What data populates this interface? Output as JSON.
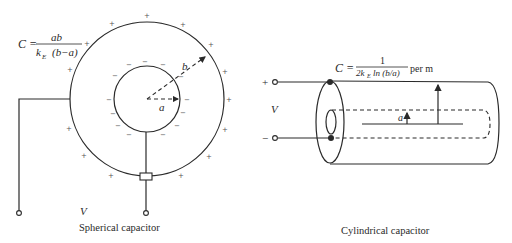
{
  "spherical": {
    "formula": {
      "lhs": "C =",
      "numerator": "ab",
      "denominator_k": "k",
      "denominator_sub": "E",
      "denominator_rest": "(b−a)"
    },
    "radius_inner_label": "a",
    "radius_outer_label": "b",
    "voltage_label": "V",
    "caption": "Spherical capacitor",
    "outer_charge": "+",
    "inner_charge": "−"
  },
  "cylindrical": {
    "formula": {
      "lhs": "C =",
      "numerator": "1",
      "denominator_pre": "2k",
      "denominator_sub": "E",
      "denominator_rest": "ln (b/a)",
      "unit": "per m"
    },
    "plus_terminal": "+",
    "minus_terminal": "−",
    "voltage_label": "V",
    "radius_inner_label": "a",
    "caption": "Cylindrical capacitor"
  }
}
